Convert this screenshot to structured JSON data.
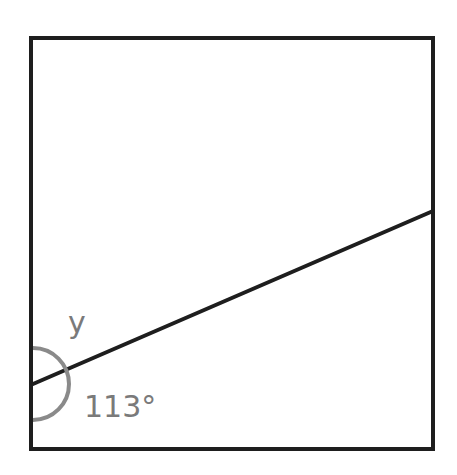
{
  "diagram": {
    "type": "geometry-angle-figure",
    "shape": "square",
    "square": {
      "x1": 31,
      "y1": 38,
      "x2": 433,
      "y2": 449
    },
    "line": {
      "from": [
        33,
        384
      ],
      "to": [
        433,
        211
      ]
    },
    "arc": {
      "center": [
        33,
        384
      ],
      "radius": 36
    },
    "labels": {
      "unknown_angle": "y",
      "known_angle": "113°"
    },
    "colors": {
      "stroke": "#1e1e1e",
      "arc": "#8a8a8a",
      "label": "#7a7a7a",
      "background": "#ffffff"
    }
  }
}
